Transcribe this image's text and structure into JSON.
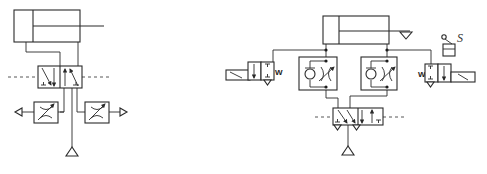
{
  "diagram": {
    "type": "pneumatic-circuit",
    "colors": {
      "line": "#2a2a2a",
      "background": "#ffffff"
    },
    "left_circuit": {
      "components": [
        {
          "id": "cylinder",
          "kind": "double-acting-cylinder"
        },
        {
          "id": "valve",
          "kind": "5/2-directional-valve"
        },
        {
          "id": "throttle-left",
          "kind": "adjustable-throttle-exhaust"
        },
        {
          "id": "throttle-right",
          "kind": "adjustable-throttle-exhaust"
        },
        {
          "id": "supply",
          "kind": "pressure-source"
        }
      ]
    },
    "right_circuit": {
      "components": [
        {
          "id": "cylinder",
          "kind": "double-acting-cylinder"
        },
        {
          "id": "check-throttle-left",
          "kind": "one-way-flow-control-valve"
        },
        {
          "id": "check-throttle-right",
          "kind": "one-way-flow-control-valve"
        },
        {
          "id": "valve-left",
          "kind": "3/2-solenoid-valve",
          "spring_label": "W"
        },
        {
          "id": "valve-right",
          "kind": "3/2-solenoid-valve",
          "spring_label": "W"
        },
        {
          "id": "main-valve",
          "kind": "5/2-directional-valve"
        },
        {
          "id": "supply",
          "kind": "pressure-source"
        },
        {
          "id": "limit-switch",
          "kind": "roller-lever",
          "label": "S"
        }
      ]
    }
  }
}
